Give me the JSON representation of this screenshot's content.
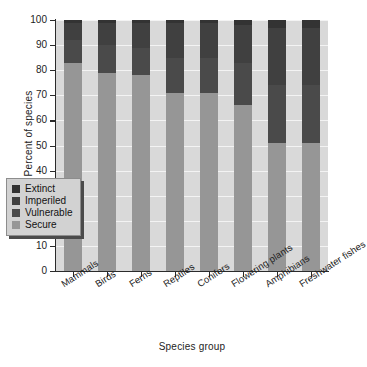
{
  "chart_data": {
    "type": "bar",
    "subtype": "stacked-percent",
    "title": "",
    "xlabel": "Species group",
    "ylabel": "Percent of species",
    "ylim": [
      0,
      100
    ],
    "yticks": [
      0,
      10,
      20,
      30,
      40,
      50,
      60,
      70,
      80,
      90,
      100
    ],
    "ytick_labels": [
      "0",
      "10",
      "20",
      "30",
      "40",
      "50",
      "60",
      "70",
      "80",
      "90",
      "100"
    ],
    "grid": true,
    "grid_color": "#f4f4f4",
    "plot_background": "#d9d9d9",
    "legend_position": "lower-left-inside",
    "categories": [
      "Mammals",
      "Birds",
      "Ferns",
      "Reptiles",
      "Conifers",
      "Flowering plants",
      "Amphibians",
      "Freshwater fishes"
    ],
    "series": [
      {
        "name": "Secure",
        "color": "#969696",
        "values": [
          83,
          79,
          78,
          71,
          71,
          66,
          51,
          51
        ]
      },
      {
        "name": "Vulnerable",
        "color": "#4a4a4a",
        "values": [
          9,
          11,
          11,
          14,
          14,
          17,
          23,
          23
        ]
      },
      {
        "name": "Imperiled",
        "color": "#404040",
        "values": [
          7,
          9,
          10,
          14,
          14,
          15,
          23,
          23
        ]
      },
      {
        "name": "Extinct",
        "color": "#333333",
        "values": [
          1,
          1,
          1,
          1,
          1,
          2,
          3,
          3
        ]
      }
    ],
    "legend_entries": [
      {
        "label": "Extinct",
        "color": "#333333"
      },
      {
        "label": "Imperiled",
        "color": "#404040"
      },
      {
        "label": "Vulnerable",
        "color": "#4a4a4a"
      },
      {
        "label": "Secure",
        "color": "#969696"
      }
    ]
  }
}
